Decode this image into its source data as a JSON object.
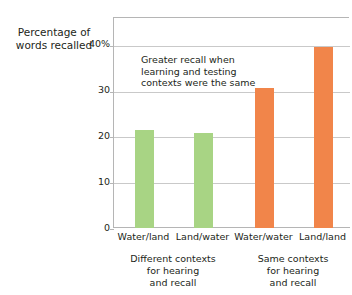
{
  "chart_data": {
    "type": "bar",
    "title": "",
    "subtitle": "",
    "xlabel": "",
    "ylabel": "Percentage of words recalled",
    "ylabel_lines": [
      "Percentage of",
      "words recalled"
    ],
    "categories": [
      "Water/land",
      "Land/water",
      "Water/water",
      "Land/land"
    ],
    "values": [
      21.5,
      20.7,
      30.5,
      39.5
    ],
    "bar_colors": [
      "#a8d484",
      "#a8d484",
      "#f1854a",
      "#f1854a"
    ],
    "ylim": [
      0,
      46.1
    ],
    "yticks": [
      0,
      10,
      20,
      30,
      40
    ],
    "ytick_labels": [
      "0",
      "10",
      "20",
      "30",
      "40%"
    ],
    "grid": "horizontal",
    "legend": "none",
    "annotations": [
      {
        "text": "Greater recall when learning and testing contexts were the same",
        "lines": [
          "Greater recall when",
          "learning and testing",
          "contexts were the same"
        ]
      }
    ],
    "group_labels": [
      {
        "text": "Different contexts for hearing and recall",
        "lines": [
          "Different contexts",
          "for hearing",
          "and recall"
        ],
        "categories": [
          "Water/land",
          "Land/water"
        ]
      },
      {
        "text": "Same contexts for hearing and recall",
        "lines": [
          "Same contexts",
          "for hearing",
          "and recall"
        ],
        "categories": [
          "Water/water",
          "Land/land"
        ]
      }
    ],
    "colors": {
      "green": "#a8d484",
      "orange": "#f1854a",
      "axis": "#b5b5b5",
      "gridline": "#c9c9c9",
      "text": "#231f20",
      "background": "#ffffff"
    }
  }
}
